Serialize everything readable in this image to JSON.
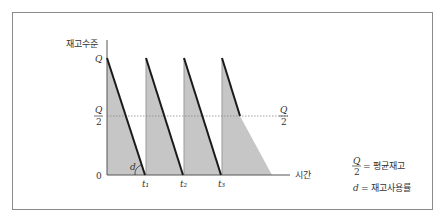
{
  "diagram": {
    "y_axis_label": "재고수준",
    "x_axis_label": "시간",
    "y_ticks": {
      "top": "Q",
      "mid_num": "Q",
      "mid_den": "2",
      "zero": "0"
    },
    "right_mid_num": "Q",
    "right_mid_den": "2",
    "slope_label": "d",
    "time_ticks": [
      "t₁",
      "t₂",
      "t₃"
    ],
    "legend": {
      "avg_num": "Q",
      "avg_den": "2",
      "avg_text": "= 평균재고",
      "usage_symbol": "d",
      "usage_text": "= 재고사용률"
    },
    "colors": {
      "fill": "#c8c8c8",
      "line": "#1a1a1a",
      "axis": "#555555",
      "frame": "#8a8a8a"
    }
  }
}
